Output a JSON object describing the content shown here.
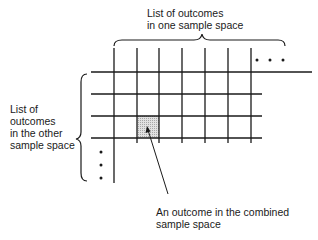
{
  "labels": {
    "top": [
      "List of outcomes",
      "in one sample space"
    ],
    "left": [
      "List of",
      "outcomes",
      "in the other",
      "sample space"
    ],
    "bottom": [
      "An outcome in the combined",
      "sample space"
    ]
  },
  "grid": {
    "columns_x": [
      114,
      137,
      159,
      182,
      205,
      228,
      251
    ],
    "rows_y": [
      72,
      94,
      116,
      138
    ],
    "highlighted_cell": {
      "col": 1,
      "row": 2
    }
  },
  "colors": {
    "line": "#1a1a1a",
    "shade": "#cfcfcf"
  }
}
